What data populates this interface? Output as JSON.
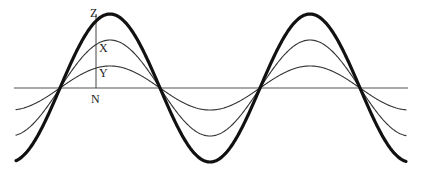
{
  "diagram": {
    "type": "wave-superposition",
    "canvas": {
      "width": 421,
      "height": 179
    },
    "baseline": {
      "y": 88,
      "x_start": 14,
      "x_end": 408,
      "color": "#555555"
    },
    "vertical_marker": {
      "x": 96,
      "y_top": 14,
      "y_bottom": 88,
      "color": "#444444"
    },
    "wave": {
      "x_start": 16,
      "x_end": 406,
      "zero_crossing_x": 60,
      "period_px": 200
    },
    "curves": [
      {
        "name": "small-wave",
        "amplitude": 22,
        "stroke": "#333333",
        "width": 1.1
      },
      {
        "name": "medium-wave",
        "amplitude": 48,
        "stroke": "#333333",
        "width": 1.1
      },
      {
        "name": "large-wave",
        "amplitude": 74,
        "stroke": "#111111",
        "width": 3.2
      }
    ],
    "labels": [
      {
        "id": "Z",
        "text": "Z",
        "x": 90,
        "y": 17
      },
      {
        "id": "X",
        "text": "X",
        "x": 99,
        "y": 52
      },
      {
        "id": "Y",
        "text": "Y",
        "x": 99,
        "y": 77
      },
      {
        "id": "N",
        "text": "N",
        "x": 91,
        "y": 103
      }
    ]
  }
}
